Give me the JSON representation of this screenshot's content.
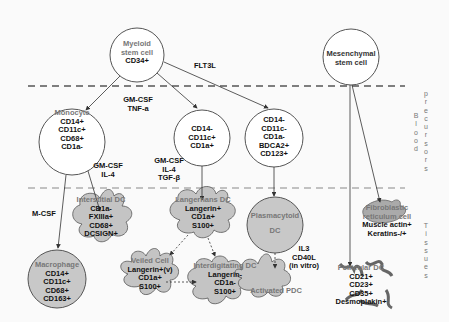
{
  "zones": {
    "precursors": "precursors",
    "blood": "Blood",
    "tissues": "Tissues"
  },
  "nodes": {
    "myeloid": {
      "title": "Myeloid stem cell",
      "title_l1": "Myeloid",
      "title_l2": "stem cell",
      "markers": [
        "CD34+"
      ]
    },
    "mesenchymal": {
      "title_l1": "Mesenchymal",
      "title_l2": "stem cell"
    },
    "monocyte": {
      "title": "Monocyte",
      "markers": [
        "CD14+",
        "CD11c+",
        "CD68+",
        "CD1a-"
      ]
    },
    "cd14neg_cd1apos": {
      "markers": [
        "CD14-",
        "CD11c+",
        "CD1a+"
      ]
    },
    "pdc_precursor": {
      "markers": [
        "CD14-",
        "CD11c-",
        "CD1a-",
        "BDCA2+",
        "CD123+"
      ]
    },
    "interstitial_dc": {
      "title": "Interstitial DC",
      "markers": [
        "CD1a-",
        "FXIIIa+",
        "CD68+",
        "DCSIGN+"
      ]
    },
    "langerhans_dc": {
      "title": "Langerhans DC",
      "markers": [
        "Langerin+",
        "CD1a+",
        "S100+"
      ]
    },
    "veiled_cell": {
      "title": "Veiled Cell",
      "markers": [
        "Langerin+(v)",
        "CD1a+",
        "S100+"
      ]
    },
    "interdigitating_dc": {
      "title": "Interdigitating DC",
      "markers": [
        "Langerin-",
        "CD1a-",
        "S100+"
      ]
    },
    "macrophage": {
      "title": "Macrophage",
      "markers": [
        "CD14+",
        "CD11c+",
        "CD68+",
        "CD163+"
      ]
    },
    "plasmacytoid_dc": {
      "title_l1": "Plasmacytoid",
      "title_l2": "DC"
    },
    "activated_pdc": {
      "title": "Activated PDC"
    },
    "fibroblastic_rc": {
      "title_l1": "Fibroblastic",
      "title_l2": "reticulum cell",
      "markers": [
        "Muscle actin+",
        "Keratins-/+"
      ]
    },
    "follicular_dc": {
      "title": "Follicular DC",
      "markers": [
        "CD21+",
        "CD23+",
        "CD35+",
        "Desmoplakin+"
      ]
    }
  },
  "factors": {
    "flt3l": "FLT3L",
    "gmcsf_tnfa": [
      "GM-CSF",
      "TNF-a"
    ],
    "gmcsf_il4": [
      "GM-CSF",
      "IL-4"
    ],
    "gmcsf_il4_tgfb": [
      "GM-CSF",
      "IL-4",
      "TGF-β"
    ],
    "mcsf": "M-CSF",
    "il3_cd40l": [
      "IL3",
      "CD40L",
      "(in vitro)"
    ]
  },
  "colors": {
    "cell_fill": "#c4c4c4",
    "cell_stroke": "#555555",
    "line": "#333333",
    "gray_text": "#777777",
    "background": "#fafafa"
  }
}
